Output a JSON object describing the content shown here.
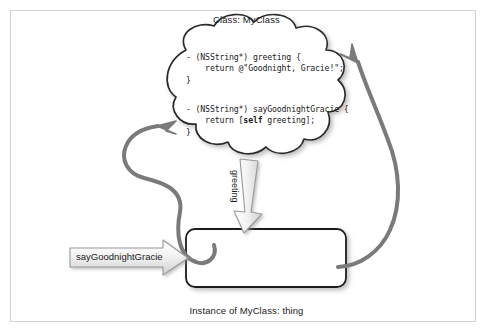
{
  "figure": {
    "title_top": "Class: MyClass",
    "title_bottom": "Instance of MyClass: thing",
    "background_color": "#ffffff",
    "frame_color": "#d2d2d2"
  },
  "class_cloud": {
    "shape": "cloud",
    "fill": "#ffffff",
    "stroke": "#2b2b2b",
    "methods": [
      {
        "name": "greeting",
        "signature": "- (NSString*) greeting {",
        "body": "    return @\"Goodnight, Gracie!\";",
        "close": "}"
      },
      {
        "name": "sayGoodnightGracie",
        "signature": "- (NSString*) sayGoodnightGracie {",
        "body_prefix": "    return [",
        "body_keyword": "self",
        "body_suffix": " greeting];",
        "close": "}"
      }
    ]
  },
  "instance_box": {
    "shape": "rounded-rectangle",
    "fill": "#ffffff",
    "stroke": "#1a1a1a",
    "label": ""
  },
  "block_arrows": [
    {
      "id": "saygoodnightgracie-arrow",
      "label": "sayGoodnightGracie",
      "direction": "right",
      "fill_start": "#ffffff",
      "fill_end": "#d8d8d8",
      "stroke": "#9a9a9a"
    },
    {
      "id": "greeting-arrow",
      "label": "greeting",
      "direction": "down",
      "fill_start": "#ffffff",
      "fill_end": "#d8d8d8",
      "stroke": "#9a9a9a"
    }
  ],
  "curved_arrows": [
    {
      "id": "instance-to-saygoodnightgracie",
      "from": "instance_box",
      "to": "sayGoodnightGracie method",
      "color": "#7a7a7a",
      "width": 4
    },
    {
      "id": "instance-to-greeting",
      "from": "instance_box",
      "to": "greeting method",
      "color": "#7a7a7a",
      "width": 4
    }
  ]
}
